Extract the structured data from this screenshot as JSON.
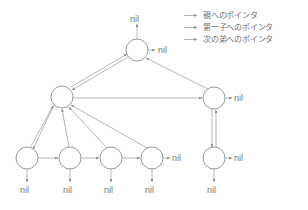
{
  "diagram": {
    "stroke_color": "#9a9a9a",
    "node_stroke_color": "#8d8d8d",
    "text_color": "#7b7b7b",
    "background": "#ffffff",
    "nil_text": "nil",
    "nodes": [
      {
        "id": "root",
        "cx": 137,
        "cy": 50,
        "r": 11
      },
      {
        "id": "mid-left",
        "cx": 62,
        "cy": 97,
        "r": 11
      },
      {
        "id": "mid-right",
        "cx": 214,
        "cy": 98,
        "r": 11
      },
      {
        "id": "leaf-1",
        "cx": 27,
        "cy": 158,
        "r": 11
      },
      {
        "id": "leaf-2",
        "cx": 70,
        "cy": 158,
        "r": 11
      },
      {
        "id": "leaf-3",
        "cx": 111,
        "cy": 158,
        "r": 11
      },
      {
        "id": "leaf-4",
        "cx": 152,
        "cy": 158,
        "r": 11
      },
      {
        "id": "leaf-5",
        "cx": 214,
        "cy": 158,
        "r": 11
      }
    ],
    "nil_labels": [
      {
        "id": "nil-root-parent",
        "text": "nil",
        "x": 130,
        "y": 14
      },
      {
        "id": "nil-root-sibling",
        "text": "nil",
        "x": 158,
        "y": 45
      },
      {
        "id": "nil-mid-right-sibling",
        "text": "nil",
        "x": 234,
        "y": 93
      },
      {
        "id": "nil-leaf-4-sibling",
        "text": "nil",
        "x": 172,
        "y": 153
      },
      {
        "id": "nil-leaf-5-sibling",
        "text": "nil",
        "x": 234,
        "y": 153
      },
      {
        "id": "nil-leaf-1-child",
        "text": "nil",
        "x": 20,
        "y": 190
      },
      {
        "id": "nil-leaf-2-child",
        "text": "nil",
        "x": 63,
        "y": 190
      },
      {
        "id": "nil-leaf-3-child",
        "text": "nil",
        "x": 104,
        "y": 190
      },
      {
        "id": "nil-leaf-4-child",
        "text": "nil",
        "x": 145,
        "y": 190
      },
      {
        "id": "nil-leaf-5-child",
        "text": "nil",
        "x": 207,
        "y": 190
      }
    ]
  },
  "legend": {
    "items": [
      {
        "id": "parent-pointer",
        "label": "親へのポインタ"
      },
      {
        "id": "first-child-pointer",
        "label": "第一子へのポインタ"
      },
      {
        "id": "next-sibling-pointer",
        "label": "次の弟へのポインタ"
      }
    ]
  }
}
